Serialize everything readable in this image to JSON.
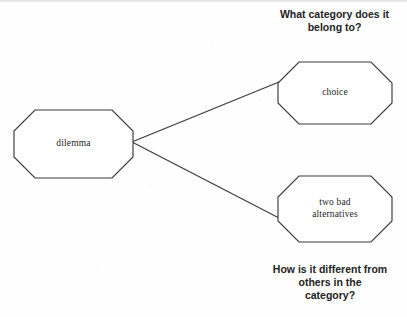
{
  "diagram": {
    "type": "concept-map",
    "background_color": "#ffffff",
    "stroke_color": "#3a3a3a",
    "text_color": "#1d1d1d",
    "nodes": [
      {
        "id": "dilemma",
        "label": "dilemma",
        "shape": "octagon",
        "role": "root-concept"
      },
      {
        "id": "choice",
        "label": "choice",
        "shape": "octagon",
        "role": "category"
      },
      {
        "id": "two-bad-alternatives",
        "label": "two bad\nalternatives",
        "shape": "octagon",
        "role": "distinguishing-feature"
      }
    ],
    "edges": [
      {
        "from": "dilemma",
        "to": "choice"
      },
      {
        "from": "dilemma",
        "to": "two-bad-alternatives"
      }
    ],
    "captions": {
      "top": "What category does it\nbelong to?",
      "bottom": "How is it different from\nothers in the\ncategory?"
    }
  }
}
